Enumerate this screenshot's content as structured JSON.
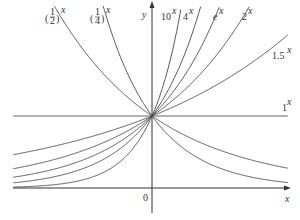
{
  "chart_data": {
    "type": "line",
    "title": "",
    "xlabel": "x",
    "ylabel": "y",
    "origin_label": "0",
    "xlim": [
      -1.9,
      1.86
    ],
    "ylim": [
      -0.45,
      2.6
    ],
    "grid": false,
    "legend": "inline labels at curve ends",
    "series": [
      {
        "name": "(1/2)^x",
        "base": 0.5,
        "label": "(1/2)^x"
      },
      {
        "name": "(1/4)^x",
        "base": 0.25,
        "label": "(1/4)^x"
      },
      {
        "name": "10^x",
        "base": 10,
        "label": "10^x"
      },
      {
        "name": "4^x",
        "base": 4,
        "label": "4^x"
      },
      {
        "name": "e^x",
        "base": 2.718,
        "label": "e^x"
      },
      {
        "name": "2^x",
        "base": 2,
        "label": "2^x"
      },
      {
        "name": "1.5^x",
        "base": 1.5,
        "label": "1.5^x"
      },
      {
        "name": "1^x",
        "base": 1,
        "label": "1^x"
      }
    ],
    "annotations": [
      "All curves pass through (0, 1)"
    ]
  },
  "labels": {
    "half": {
      "base_num": "1",
      "base_den": "2",
      "exp": "x"
    },
    "quarter": {
      "base_num": "1",
      "base_den": "4",
      "exp": "x"
    },
    "ten": {
      "base": "10",
      "exp": "x"
    },
    "four": {
      "base": "4",
      "exp": "x"
    },
    "e": {
      "base": "e",
      "exp": "x"
    },
    "two": {
      "base": "2",
      "exp": "x"
    },
    "onehalf": {
      "base": "1.5",
      "exp": "x"
    },
    "one": {
      "base": "1",
      "exp": "x"
    },
    "x_axis": "x",
    "y_axis": "y",
    "origin": "0"
  },
  "style": {
    "line_color": "#555555",
    "axis_color": "#333333"
  }
}
